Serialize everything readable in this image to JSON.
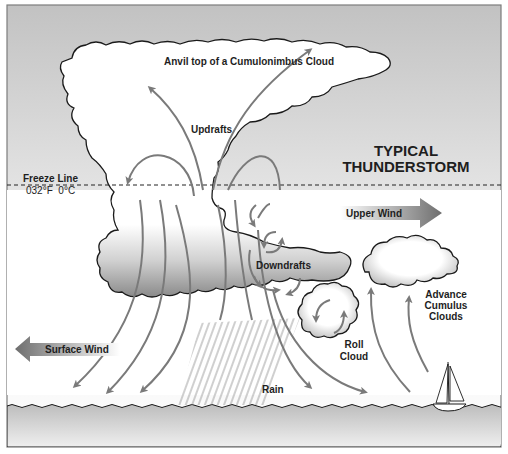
{
  "diagram": {
    "title_line1": "TYPICAL",
    "title_line2": "THUNDERSTORM",
    "labels": {
      "anvil": "Anvil top of a Cumulonimbus Cloud",
      "updrafts": "Updrafts",
      "freeze_line": "Freeze Line",
      "freeze_temp": "032°F  0°C",
      "upper_wind": "Upper Wind",
      "downdrafts": "Downdrafts",
      "surface_wind": "Surface Wind",
      "rain": "Rain",
      "roll_cloud_line1": "Roll",
      "roll_cloud_line2": "Cloud",
      "advance_line1": "Advance",
      "advance_line2": "Cumulus",
      "advance_line3": "Clouds"
    },
    "elements": {
      "cumulonimbus_cloud": "anvil-shaped storm cloud",
      "freeze_line": "dashed horizontal line",
      "upper_wind_arrow": "arrow pointing right",
      "surface_wind_arrow": "arrow pointing left",
      "sailboat": "sailboat on water",
      "ground_water": "wavy water surface"
    },
    "colors": {
      "sky_top": "#c4c4c4",
      "cloud_fill": "#ffffff",
      "cloud_base_shade": "#8c8c8c",
      "arrow_gray": "#7a7a7a",
      "water": "#c8c8c8",
      "text": "#1e1e1e"
    }
  }
}
